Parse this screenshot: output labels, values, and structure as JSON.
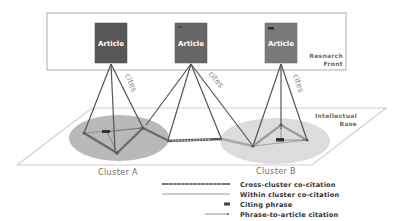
{
  "diagram": {
    "research_front": {
      "label_line1": "Resnarch",
      "label_line2": "Front",
      "articles": [
        {
          "label": "Article",
          "color": "#585858"
        },
        {
          "label": "Article",
          "color": "#6a6a6a"
        },
        {
          "label": "Article",
          "color": "#7a7a7a"
        }
      ]
    },
    "edge_labels": {
      "cites_1": "cites",
      "cites_2": "cites",
      "cites_3": "cites"
    },
    "intellectual_base": {
      "label_line1": "Intellectual",
      "label_line2": "Base"
    },
    "clusters": [
      {
        "label": "Cluster A",
        "color": "#b9b9b9"
      },
      {
        "label": "Cluster B",
        "color": "#dcdcdc"
      }
    ],
    "legend": {
      "items": [
        {
          "label": "Cross-cluster co-citation",
          "symbol": "thick-dashed-line"
        },
        {
          "label": "Within cluster co-citation",
          "symbol": "thin-line"
        },
        {
          "label": "Citing phrase",
          "symbol": "dark-rectangle"
        },
        {
          "label": "Phrase-to-article citation",
          "symbol": "arrow"
        }
      ]
    }
  }
}
